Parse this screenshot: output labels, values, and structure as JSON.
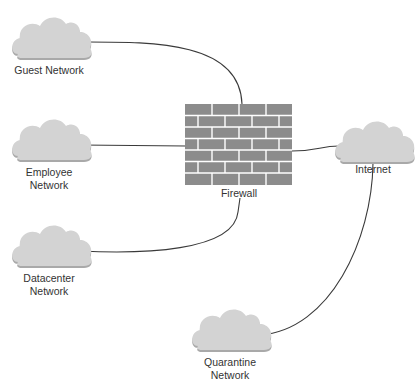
{
  "diagram": {
    "colors": {
      "cloud_fill": "#d3d3d3",
      "cloud_shadow": "#a9a9a9",
      "brick": "#8c8c8c",
      "mortar": "#ffffff",
      "line": "#3a3a3a",
      "text": "#333333"
    },
    "nodes": [
      {
        "id": "guest",
        "type": "cloud",
        "label_lines": [
          "Guest Network"
        ]
      },
      {
        "id": "employee",
        "type": "cloud",
        "label_lines": [
          "Employee",
          "Network"
        ]
      },
      {
        "id": "datacenter",
        "type": "cloud",
        "label_lines": [
          "Datacenter",
          "Network"
        ]
      },
      {
        "id": "firewall",
        "type": "firewall",
        "label_lines": [
          "Firewall"
        ]
      },
      {
        "id": "internet",
        "type": "cloud",
        "label_lines": [
          "Internet"
        ]
      },
      {
        "id": "quarantine",
        "type": "cloud",
        "label_lines": [
          "Quarantine",
          "Network"
        ]
      }
    ],
    "edges": [
      {
        "from": "guest",
        "to": "firewall"
      },
      {
        "from": "employee",
        "to": "firewall"
      },
      {
        "from": "datacenter",
        "to": "firewall"
      },
      {
        "from": "firewall",
        "to": "internet"
      },
      {
        "from": "internet",
        "to": "quarantine"
      }
    ]
  }
}
